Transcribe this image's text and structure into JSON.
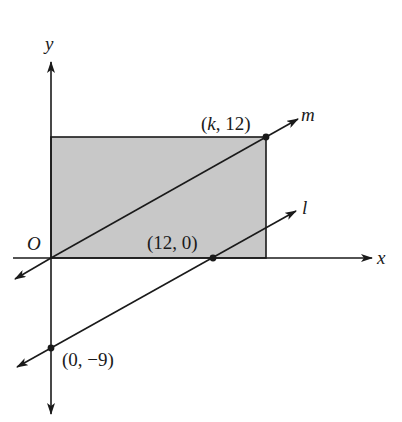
{
  "diagram": {
    "type": "coordinate-geometry",
    "colors": {
      "ink": "#1a1a1a",
      "shade": "#c8c8c8",
      "background": "#ffffff"
    },
    "axes": {
      "x_label": "x",
      "y_label": "y",
      "origin_label": "O"
    },
    "rectangle": {
      "corners": [
        "O",
        "(k, 12)"
      ],
      "shaded": true
    },
    "lines": [
      {
        "name": "m",
        "label": "m",
        "passes_through": [
          "(0, 0)",
          "(k, 12)"
        ]
      },
      {
        "name": "l",
        "label": "l",
        "passes_through": [
          "(12, 0)",
          "(0, -9)"
        ]
      }
    ],
    "points": [
      {
        "id": "k12",
        "label": "(k, 12)"
      },
      {
        "id": "p120",
        "label": "(12, 0)"
      },
      {
        "id": "p0m9",
        "label": "(0, −9)"
      }
    ]
  }
}
